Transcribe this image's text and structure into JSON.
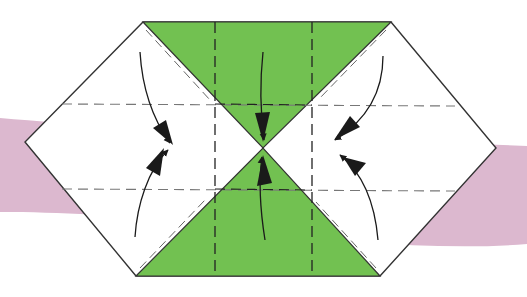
{
  "diagram": {
    "colors": {
      "background": "#ffffff",
      "band": "#dcb8cf",
      "paper_white": "#ffffff",
      "paper_green": "#72c151",
      "outline": "#333333",
      "dash_light": "#777777",
      "dash_dark": "#222222",
      "arrow": "#1a1a1a"
    },
    "elements": {
      "band": "pink background band",
      "hexagon": "folded paper (hexagon outline)",
      "green_top": "green triangle top (colored side showing)",
      "green_bottom": "green triangle bottom (colored side showing)",
      "valley_folds": "dashed valley fold lines",
      "arrows": "fold direction arrows"
    },
    "arrows": [
      {
        "id": "top-left",
        "direction": "down-right to center-left"
      },
      {
        "id": "bottom-left",
        "direction": "up-right to center-left"
      },
      {
        "id": "top-center",
        "direction": "down to center"
      },
      {
        "id": "bottom-center",
        "direction": "up to center"
      },
      {
        "id": "top-right",
        "direction": "down-left to center-right"
      },
      {
        "id": "bottom-right",
        "direction": "up-left to center-right"
      }
    ]
  }
}
